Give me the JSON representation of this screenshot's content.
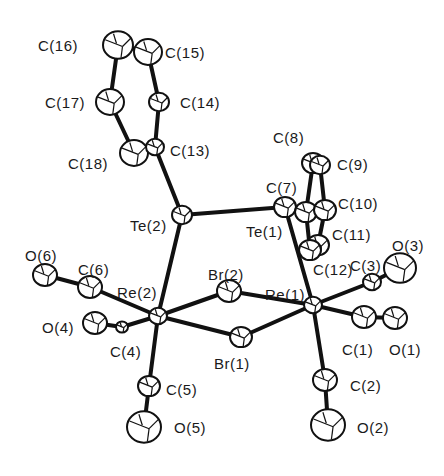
{
  "figure": {
    "type": "ORTEP molecular structure",
    "line_color": "#111111",
    "background": "#ffffff"
  },
  "atoms": [
    {
      "id": "C16",
      "label": "C(16)",
      "x": 118,
      "y": 45,
      "r": 15,
      "lx": 38,
      "ly": 38
    },
    {
      "id": "C15",
      "label": "C(15)",
      "x": 148,
      "y": 52,
      "r": 14,
      "lx": 165,
      "ly": 45
    },
    {
      "id": "C17",
      "label": "C(17)",
      "x": 110,
      "y": 102,
      "r": 14,
      "lx": 45,
      "ly": 95
    },
    {
      "id": "C14",
      "label": "C(14)",
      "x": 159,
      "y": 102,
      "r": 10,
      "lx": 180,
      "ly": 95
    },
    {
      "id": "C18",
      "label": "C(18)",
      "x": 134,
      "y": 153,
      "r": 14,
      "lx": 68,
      "ly": 156
    },
    {
      "id": "C13",
      "label": "C(13)",
      "x": 155,
      "y": 147,
      "r": 9,
      "lx": 170,
      "ly": 143
    },
    {
      "id": "Te2",
      "label": "Te(2)",
      "x": 182,
      "y": 215,
      "r": 10,
      "lx": 130,
      "ly": 218
    },
    {
      "id": "Te1",
      "label": "Te(1)",
      "x": 285,
      "y": 207,
      "r": 11,
      "lx": 246,
      "ly": 224
    },
    {
      "id": "C7",
      "label": "C(7)",
      "x": 306,
      "y": 212,
      "r": 11,
      "lx": 266,
      "ly": 180
    },
    {
      "id": "C8",
      "label": "C(8)",
      "x": 313,
      "y": 163,
      "r": 11,
      "lx": 273,
      "ly": 130
    },
    {
      "id": "C9",
      "label": "C(9)",
      "x": 320,
      "y": 165,
      "r": 10,
      "lx": 337,
      "ly": 157
    },
    {
      "id": "C10",
      "label": "C(10)",
      "x": 325,
      "y": 210,
      "r": 11,
      "lx": 338,
      "ly": 196
    },
    {
      "id": "C11",
      "label": "C(11)",
      "x": 318,
      "y": 245,
      "r": 11,
      "lx": 332,
      "ly": 227
    },
    {
      "id": "C12",
      "label": "C(12)",
      "x": 310,
      "y": 250,
      "r": 11,
      "lx": 313,
      "ly": 262
    },
    {
      "id": "C3",
      "label": "C(3)",
      "x": 372,
      "y": 282,
      "r": 9,
      "lx": 350,
      "ly": 258
    },
    {
      "id": "O3",
      "label": "O(3)",
      "x": 400,
      "y": 268,
      "r": 16,
      "lx": 392,
      "ly": 238
    },
    {
      "id": "Re1",
      "label": "Re(1)",
      "x": 313,
      "y": 305,
      "r": 9,
      "lx": 265,
      "ly": 287
    },
    {
      "id": "C1",
      "label": "C(1)",
      "x": 364,
      "y": 317,
      "r": 12,
      "lx": 342,
      "ly": 342
    },
    {
      "id": "O1",
      "label": "O(1)",
      "x": 395,
      "y": 318,
      "r": 12,
      "lx": 389,
      "ly": 342
    },
    {
      "id": "Br2",
      "label": "Br(2)",
      "x": 229,
      "y": 291,
      "r": 12,
      "lx": 208,
      "ly": 267
    },
    {
      "id": "Br1",
      "label": "Br(1)",
      "x": 241,
      "y": 337,
      "r": 11,
      "lx": 214,
      "ly": 356
    },
    {
      "id": "Re2",
      "label": "Re(2)",
      "x": 158,
      "y": 316,
      "r": 9,
      "lx": 117,
      "ly": 285
    },
    {
      "id": "C6",
      "label": "C(6)",
      "x": 90,
      "y": 287,
      "r": 12,
      "lx": 78,
      "ly": 262
    },
    {
      "id": "O6",
      "label": "O(6)",
      "x": 45,
      "y": 275,
      "r": 12,
      "lx": 25,
      "ly": 248
    },
    {
      "id": "C4",
      "label": "C(4)",
      "x": 122,
      "y": 327,
      "r": 6,
      "lx": 110,
      "ly": 344
    },
    {
      "id": "O4",
      "label": "O(4)",
      "x": 95,
      "y": 323,
      "r": 12,
      "lx": 42,
      "ly": 320
    },
    {
      "id": "C5",
      "label": "C(5)",
      "x": 149,
      "y": 386,
      "r": 11,
      "lx": 166,
      "ly": 382
    },
    {
      "id": "O5",
      "label": "O(5)",
      "x": 144,
      "y": 427,
      "r": 17,
      "lx": 174,
      "ly": 420
    },
    {
      "id": "C2",
      "label": "C(2)",
      "x": 325,
      "y": 380,
      "r": 12,
      "lx": 350,
      "ly": 378
    },
    {
      "id": "O2",
      "label": "O(2)",
      "x": 328,
      "y": 425,
      "r": 17,
      "lx": 357,
      "ly": 420
    }
  ],
  "bonds": [
    [
      "C16",
      "C17"
    ],
    [
      "C15",
      "C14"
    ],
    [
      "C17",
      "C18"
    ],
    [
      "C14",
      "C13"
    ],
    [
      "C16",
      "C15"
    ],
    [
      "C18",
      "C13"
    ],
    [
      "C13",
      "Te2"
    ],
    [
      "Te2",
      "Te1"
    ],
    [
      "Te2",
      "Re2"
    ],
    [
      "Te1",
      "C7"
    ],
    [
      "Te1",
      "Re1"
    ],
    [
      "C7",
      "C8"
    ],
    [
      "C8",
      "C9"
    ],
    [
      "C9",
      "C10"
    ],
    [
      "C10",
      "C11"
    ],
    [
      "C11",
      "C12"
    ],
    [
      "C12",
      "C7"
    ],
    [
      "Re1",
      "Br2"
    ],
    [
      "Re1",
      "Br1"
    ],
    [
      "Re2",
      "Br2"
    ],
    [
      "Re2",
      "Br1"
    ],
    [
      "Re1",
      "C3"
    ],
    [
      "C3",
      "O3"
    ],
    [
      "Re1",
      "C1"
    ],
    [
      "C1",
      "O1"
    ],
    [
      "Re1",
      "C2"
    ],
    [
      "C2",
      "O2"
    ],
    [
      "Re2",
      "C6"
    ],
    [
      "C6",
      "O6"
    ],
    [
      "Re2",
      "C4"
    ],
    [
      "C4",
      "O4"
    ],
    [
      "Re2",
      "C5"
    ],
    [
      "C5",
      "O5"
    ]
  ]
}
